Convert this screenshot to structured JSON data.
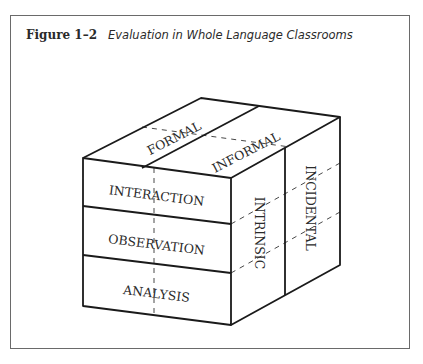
{
  "figure": {
    "number": "Figure 1–2",
    "title": "Evaluation in Whole Language Classrooms"
  },
  "cube": {
    "top_face": [
      "FORMAL",
      "INFORMAL"
    ],
    "front_face": [
      "INTERACTION",
      "OBSERVATION",
      "ANALYSIS"
    ],
    "side_face": [
      "INTRINSIC",
      "INCIDENTAL"
    ]
  }
}
